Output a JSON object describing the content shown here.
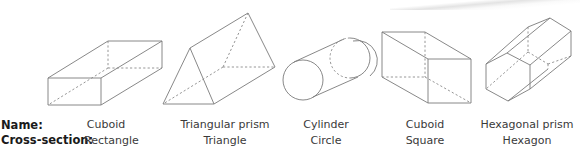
{
  "labels": {
    "name_row": "Name:",
    "cross_section_row": "Cross-section:"
  },
  "shapes": [
    {
      "id": "cuboid-rectangle",
      "name": "Cuboid",
      "cross_section": "Rectangle"
    },
    {
      "id": "triangular-prism",
      "name": "Triangular prism",
      "cross_section": "Triangle"
    },
    {
      "id": "cylinder",
      "name": "Cylinder",
      "cross_section": "Circle"
    },
    {
      "id": "cuboid-square",
      "name": "Cuboid",
      "cross_section": "Square"
    },
    {
      "id": "hexagonal-prism",
      "name": "Hexagonal prism",
      "cross_section": "Hexagon"
    }
  ],
  "colors": {
    "line": "#7a7a7a",
    "text": "#3a3a3a",
    "row_label": "#1a1a1a",
    "background": "#ffffff"
  }
}
